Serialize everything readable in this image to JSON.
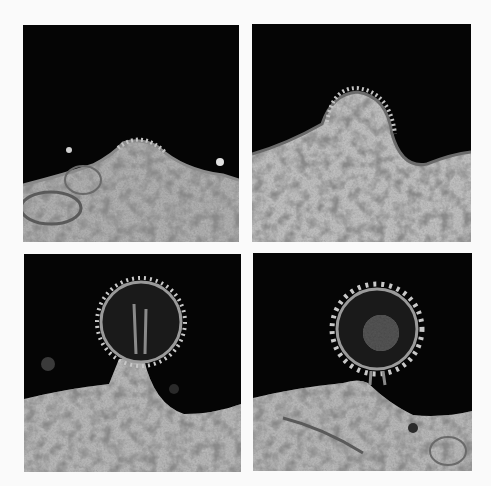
{
  "figure": {
    "background_color": "#fafafa",
    "panels": [
      {
        "position": "top-left",
        "stage": "early membrane bulge with spike coat"
      },
      {
        "position": "top-right",
        "stage": "dome-shaped bud protruding from membrane"
      },
      {
        "position": "bottom-left",
        "stage": "spherical bud attached by broad stalk"
      },
      {
        "position": "bottom-right",
        "stage": "nearly released spherical virion on thin stalk"
      }
    ],
    "colors": {
      "extracellular": "#050505",
      "cytoplasm": "#b8b8b8",
      "granules": "#4a4a4a",
      "spikes": "#c8c8c8"
    }
  }
}
